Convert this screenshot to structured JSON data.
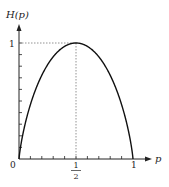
{
  "chart_data": {
    "type": "line",
    "title": "",
    "xlabel": "p",
    "ylabel": "H(p)",
    "function": "binary entropy H(p) = -p log2 p - (1-p) log2 (1-p)",
    "x": [
      0,
      0.05,
      0.1,
      0.15,
      0.2,
      0.25,
      0.3,
      0.35,
      0.4,
      0.45,
      0.5,
      0.55,
      0.6,
      0.65,
      0.7,
      0.75,
      0.8,
      0.85,
      0.9,
      0.95,
      1
    ],
    "series": [
      {
        "name": "H(p)",
        "values": [
          0,
          0.286,
          0.469,
          0.61,
          0.722,
          0.811,
          0.881,
          0.934,
          0.971,
          0.993,
          1,
          0.993,
          0.971,
          0.934,
          0.881,
          0.811,
          0.722,
          0.61,
          0.469,
          0.286,
          0
        ]
      }
    ],
    "xlim": [
      0,
      1
    ],
    "ylim": [
      0,
      1
    ],
    "x_tick_labels": [
      "0",
      "1/2",
      "1"
    ],
    "y_tick_labels": [
      "1"
    ],
    "x_minor_ticks": 10,
    "y_minor_ticks": 10,
    "annotations": [
      "dashed guide from (1/2, 0) to (1/2, 1)",
      "dashed guide from (0, 1) to (1/2, 1)"
    ],
    "grid": false,
    "legend": "none"
  },
  "labels": {
    "y_axis": "H(p)",
    "x_axis": "p",
    "origin": "0",
    "x_one": "1",
    "y_one": "1",
    "half_num": "1",
    "half_den": "2"
  },
  "colors": {
    "curve": "#111111",
    "axis": "#222222",
    "guide": "#777777"
  }
}
